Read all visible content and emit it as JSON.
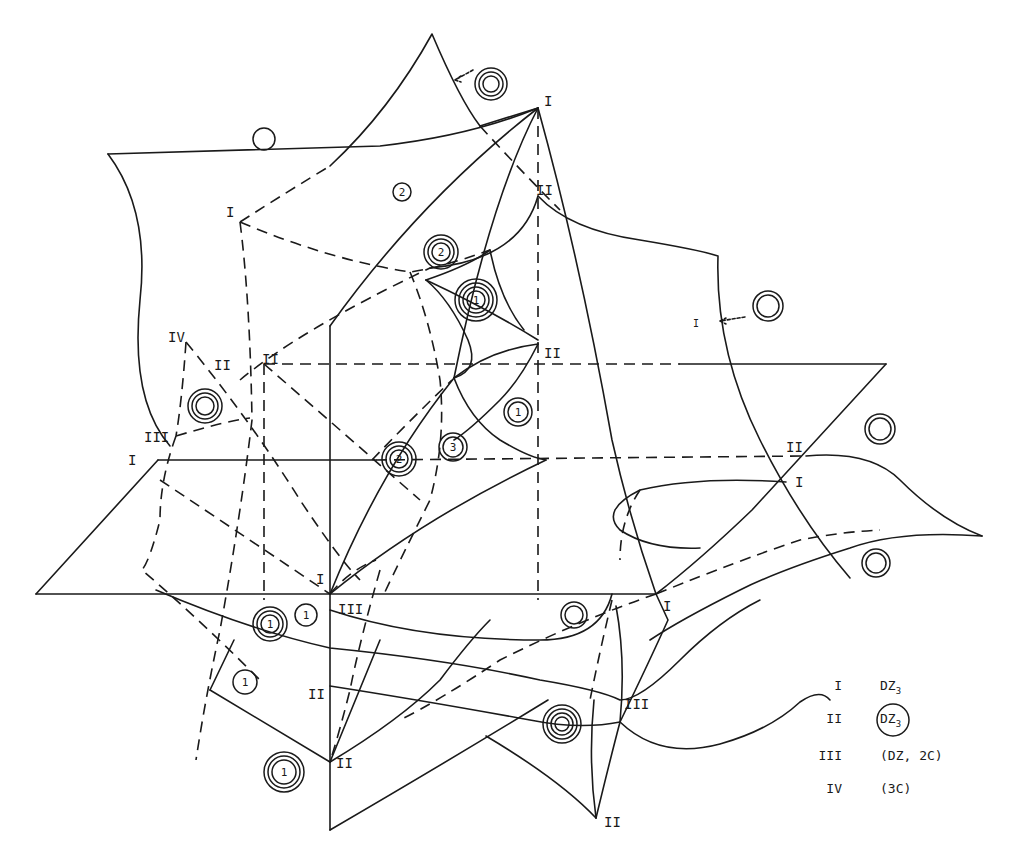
{
  "diagram": {
    "type": "bifurcation-surface-diagram",
    "stroke_color": "#1a1a1a",
    "background": "#ffffff"
  },
  "point_labels": [
    {
      "id": "top-I",
      "text": "I",
      "x": 548,
      "y": 104
    },
    {
      "id": "upper-left-I",
      "text": "I",
      "x": 228,
      "y": 215
    },
    {
      "id": "upper-right-II",
      "text": "II",
      "x": 536,
      "y": 193
    },
    {
      "id": "center-II",
      "text": "II",
      "x": 546,
      "y": 356
    },
    {
      "id": "right-I",
      "text": "I",
      "x": 693,
      "y": 327
    },
    {
      "id": "left-IV",
      "text": "IV",
      "x": 172,
      "y": 339
    },
    {
      "id": "left-II-a",
      "text": "II",
      "x": 215,
      "y": 367
    },
    {
      "id": "left-II-b",
      "text": "II",
      "x": 264,
      "y": 362
    },
    {
      "id": "left-III",
      "text": "III",
      "x": 146,
      "y": 440
    },
    {
      "id": "left-I",
      "text": "I",
      "x": 130,
      "y": 463
    },
    {
      "id": "right-II",
      "text": "II",
      "x": 787,
      "y": 450
    },
    {
      "id": "right-I-lower",
      "text": "I",
      "x": 795,
      "y": 485
    },
    {
      "id": "mid-I",
      "text": "I",
      "x": 316,
      "y": 583
    },
    {
      "id": "mid-III",
      "text": "III",
      "x": 338,
      "y": 612
    },
    {
      "id": "lower-right-I",
      "text": "I",
      "x": 665,
      "y": 609
    },
    {
      "id": "lower-II",
      "text": "II",
      "x": 309,
      "y": 697
    },
    {
      "id": "lower-right-III",
      "text": "III",
      "x": 625,
      "y": 707
    },
    {
      "id": "bottom-II",
      "text": "II",
      "x": 336,
      "y": 766
    },
    {
      "id": "bottom-right-II",
      "text": "II",
      "x": 605,
      "y": 825
    }
  ],
  "region_markers": [
    {
      "id": "m1",
      "rings": 3,
      "number": "",
      "x": 491,
      "y": 84,
      "r": 16
    },
    {
      "id": "m2",
      "rings": 1,
      "number": "",
      "x": 264,
      "y": 139,
      "r": 11
    },
    {
      "id": "m3",
      "rings": 1,
      "number": "2",
      "x": 402,
      "y": 192,
      "r": 9
    },
    {
      "id": "m4",
      "rings": 3,
      "number": "2",
      "x": 441,
      "y": 252,
      "r": 17
    },
    {
      "id": "m5",
      "rings": 4,
      "number": "1",
      "x": 476,
      "y": 300,
      "r": 21
    },
    {
      "id": "m6",
      "rings": 2,
      "number": "",
      "x": 768,
      "y": 306,
      "r": 15
    },
    {
      "id": "m7",
      "rings": 3,
      "number": "",
      "x": 205,
      "y": 406,
      "r": 17
    },
    {
      "id": "m8",
      "rings": 2,
      "number": "1",
      "x": 518,
      "y": 412,
      "r": 14
    },
    {
      "id": "m9",
      "rings": 2,
      "number": "3",
      "x": 453,
      "y": 447,
      "r": 14
    },
    {
      "id": "m10",
      "rings": 3,
      "number": "2",
      "x": 399,
      "y": 459,
      "r": 17
    },
    {
      "id": "m11",
      "rings": 2,
      "number": "",
      "x": 880,
      "y": 429,
      "r": 15
    },
    {
      "id": "m12",
      "rings": 2,
      "number": "",
      "x": 876,
      "y": 563,
      "r": 14
    },
    {
      "id": "m13",
      "rings": 2,
      "number": "",
      "x": 574,
      "y": 615,
      "r": 13
    },
    {
      "id": "m14",
      "rings": 3,
      "number": "1",
      "x": 270,
      "y": 624,
      "r": 17
    },
    {
      "id": "m15",
      "rings": 1,
      "number": "1",
      "x": 306,
      "y": 615,
      "r": 11
    },
    {
      "id": "m16",
      "rings": 1,
      "number": "1",
      "x": 245,
      "y": 682,
      "r": 12
    },
    {
      "id": "m17",
      "rings": 4,
      "number": "",
      "x": 562,
      "y": 724,
      "r": 19
    },
    {
      "id": "m18",
      "rings": 3,
      "number": "1",
      "x": 284,
      "y": 772,
      "r": 20
    }
  ],
  "legend": {
    "items": [
      {
        "key": "I",
        "value": "DZ",
        "subscript": "3",
        "circled": false
      },
      {
        "key": "II",
        "value": "DZ",
        "subscript": "3",
        "circled": true
      },
      {
        "key": "III",
        "value": "(DZ, 2C)",
        "subscript": "",
        "circled": false
      },
      {
        "key": "IV",
        "value": "(3C)",
        "subscript": "",
        "circled": false
      }
    ]
  }
}
